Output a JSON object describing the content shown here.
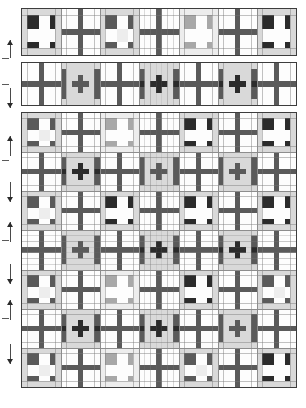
{
  "document": {
    "title": "Quilt block layout diagram",
    "caption": ""
  },
  "palette": {
    "background": "#ffffff",
    "fabric_white": "#fdfdfd",
    "fabric_light_gray": "#d9d9d9",
    "fabric_pale_gray": "#ededed",
    "fabric_medium_gray": "#a8a8a8",
    "fabric_dark_gray": "#5a5a5a",
    "fabric_black": "#2b2b2b",
    "outline": "#3d3d3d",
    "seam_line": "#8d8d8d",
    "arrow": "#2b2b2b"
  },
  "layout": {
    "canvas_width": 306,
    "canvas_height": 408,
    "panels": [
      {
        "name": "top-border-strip",
        "x": 21,
        "y": 8,
        "w": 276,
        "h": 48,
        "rows": 1,
        "cols": 7
      },
      {
        "name": "second-border-strip",
        "x": 21,
        "y": 62,
        "w": 276,
        "h": 44,
        "rows": 1,
        "cols": 7
      },
      {
        "name": "main-quilt-body",
        "x": 21,
        "y": 112,
        "w": 276,
        "h": 276,
        "rows": 7,
        "cols": 7
      }
    ]
  },
  "blocks": {
    "legend": [
      {
        "id": "ninepatch-dark",
        "label": "Nine-patch block, dark squares on light background"
      },
      {
        "id": "ninepatch-medium",
        "label": "Nine-patch block, medium gray squares"
      },
      {
        "id": "ninepatch-pale",
        "label": "Nine-patch block, pale gray squares"
      },
      {
        "id": "cross-plain",
        "label": "Plain cross / sashing block on white"
      },
      {
        "id": "cross-dark",
        "label": "Dark cross block framed in light gray"
      },
      {
        "id": "cross-medium",
        "label": "Medium cross block framed in light gray"
      }
    ]
  },
  "strip_top": {
    "name": "top-border-strip",
    "cells": [
      "ninepatch-dark",
      "cross-plain",
      "ninepatch-medium",
      "cross-plain",
      "ninepatch-pale",
      "cross-plain",
      "ninepatch-dark"
    ]
  },
  "strip_second": {
    "name": "second-border-strip",
    "cells": [
      "cross-plain",
      "cross-medium",
      "cross-plain",
      "cross-dark",
      "cross-plain",
      "cross-dark",
      "cross-plain"
    ]
  },
  "main_body": {
    "name": "main-quilt-body",
    "rows": [
      [
        "ninepatch-medium",
        "cross-plain",
        "ninepatch-pale",
        "cross-plain",
        "ninepatch-dark",
        "cross-plain",
        "ninepatch-dark"
      ],
      [
        "cross-plain",
        "cross-dark",
        "cross-plain",
        "cross-medium",
        "cross-plain",
        "cross-medium",
        "cross-plain"
      ],
      [
        "ninepatch-medium",
        "cross-plain",
        "ninepatch-dark",
        "cross-plain",
        "ninepatch-dark",
        "cross-plain",
        "ninepatch-dark"
      ],
      [
        "cross-plain",
        "cross-medium",
        "cross-plain",
        "cross-dark",
        "cross-plain",
        "cross-dark",
        "cross-plain"
      ],
      [
        "ninepatch-medium",
        "cross-plain",
        "ninepatch-pale",
        "cross-plain",
        "ninepatch-dark",
        "cross-plain",
        "ninepatch-medium"
      ],
      [
        "cross-plain",
        "cross-dark",
        "cross-plain",
        "cross-dark",
        "cross-plain",
        "cross-medium",
        "cross-plain"
      ],
      [
        "ninepatch-medium",
        "cross-plain",
        "ninepatch-pale",
        "cross-plain",
        "ninepatch-medium",
        "cross-plain",
        "ninepatch-dark"
      ]
    ]
  },
  "dimension_markers": [
    {
      "name": "dim-marker-1",
      "y": 40,
      "h": 18,
      "direction": "up"
    },
    {
      "name": "dim-marker-2",
      "y": 88,
      "h": 20,
      "direction": "down"
    },
    {
      "name": "dim-marker-3",
      "y": 136,
      "h": 20,
      "direction": "up"
    },
    {
      "name": "dim-marker-4",
      "y": 182,
      "h": 20,
      "direction": "down"
    },
    {
      "name": "dim-marker-5",
      "y": 222,
      "h": 20,
      "direction": "up"
    },
    {
      "name": "dim-marker-6",
      "y": 264,
      "h": 20,
      "direction": "down"
    },
    {
      "name": "dim-marker-7",
      "y": 300,
      "h": 20,
      "direction": "up"
    },
    {
      "name": "dim-marker-8",
      "y": 344,
      "h": 20,
      "direction": "down"
    }
  ],
  "dimension_ticks": [
    {
      "name": "dim-tick-1",
      "y": 58
    },
    {
      "name": "dim-tick-2",
      "y": 84
    },
    {
      "name": "dim-tick-3",
      "y": 160
    },
    {
      "name": "dim-tick-4",
      "y": 240
    },
    {
      "name": "dim-tick-5",
      "y": 318
    }
  ]
}
